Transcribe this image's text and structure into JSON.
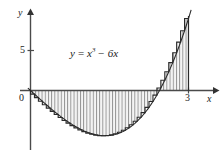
{
  "figure": {
    "kind": "riemann-sum-area-plot",
    "background_color": "#ffffff",
    "line_color": "#1a1a1a",
    "hatch_color": "#8f8f8f",
    "fill_color": "#f2f2f2"
  },
  "axes": {
    "y_axis_label": "y",
    "x_axis_label": "x",
    "origin_label": "0",
    "y_ticks": [
      {
        "label": "5",
        "value": 5
      }
    ],
    "x_ticks": [
      {
        "label": "3",
        "value": 3
      }
    ],
    "xlim": [
      -0.2,
      3.55
    ],
    "ylim": [
      -5.5,
      10.5
    ],
    "grid": false
  },
  "annotation": {
    "equation_y": "y",
    "equation_eq": "=",
    "equation_base": "x",
    "equation_exp": "3",
    "equation_tail": "− 6x",
    "equation_plain": "y = x³ − 6x"
  },
  "chart_data": {
    "type": "area",
    "title": "",
    "xlabel": "x",
    "ylabel": "y",
    "xlim": [
      -0.2,
      3.55
    ],
    "ylim": [
      -5.5,
      10.5
    ],
    "grid": false,
    "legend": "none",
    "function": "y = x^3 - 6x",
    "shaded_interval": [
      0,
      3
    ],
    "shading_style": "vertical-hatch-riemann-rectangles",
    "n_rectangles": 40,
    "rectangle_rule": "right-endpoint",
    "roots_in_view": [
      0,
      2.449
    ],
    "local_minimum": {
      "x": 1.414,
      "y": -5.657
    },
    "endpoint_value": {
      "x": 3,
      "y": 9
    },
    "x": [
      0,
      0.15,
      0.3,
      0.45,
      0.6,
      0.75,
      0.9,
      1.05,
      1.2,
      1.35,
      1.5,
      1.65,
      1.8,
      1.95,
      2.1,
      2.25,
      2.4,
      2.55,
      2.7,
      2.85,
      3.0
    ],
    "y": [
      0,
      -0.897,
      -1.773,
      -2.609,
      -3.384,
      -4.078,
      -4.671,
      -5.142,
      -5.472,
      -4.64,
      -5.625,
      -5.407,
      -4.968,
      -4.285,
      -3.339,
      -2.109,
      -0.576,
      1.281,
      3.483,
      6.051,
      9.0
    ],
    "tick_labels": {
      "x": [
        "3"
      ],
      "y": [
        "5"
      ]
    }
  }
}
